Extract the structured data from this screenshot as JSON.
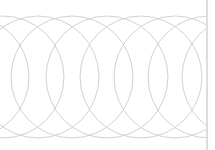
{
  "pattern": {
    "shape": "overlapping-circles",
    "stroke_color": "#d2d2d2",
    "stroke_width": 1,
    "center_y": 77,
    "radius": 61,
    "centers_x": [
      -32,
      3,
      38,
      72,
      107,
      141,
      175,
      209,
      243
    ],
    "clip_right": 206
  },
  "divider": {
    "x": 207,
    "color": "#dddddd",
    "width": 2
  }
}
